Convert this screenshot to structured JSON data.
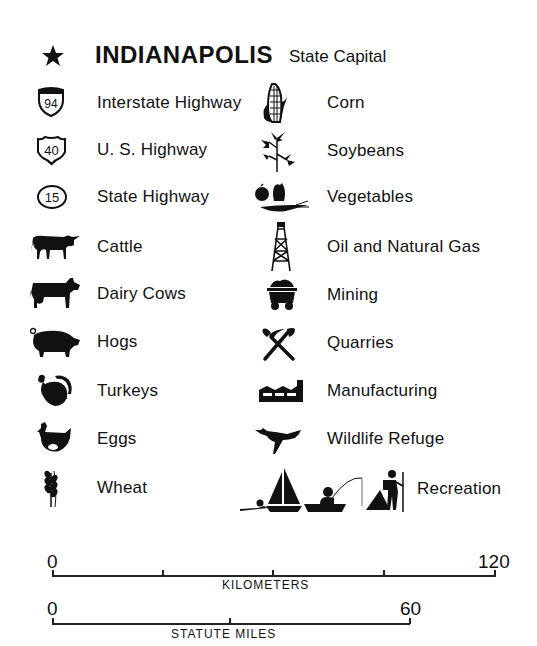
{
  "capital": {
    "name": "INDIANAPOLIS",
    "suffix": "State Capital",
    "icon": "star-icon"
  },
  "left_items": [
    {
      "label": "Interstate Highway",
      "icon": "interstate-shield-icon",
      "shield_text": "94"
    },
    {
      "label": "U. S. Highway",
      "icon": "us-highway-shield-icon",
      "shield_text": "40"
    },
    {
      "label": "State Highway",
      "icon": "state-highway-oval-icon",
      "shield_text": "15"
    },
    {
      "label": "Cattle",
      "icon": "cattle-icon"
    },
    {
      "label": "Dairy Cows",
      "icon": "dairy-cow-icon"
    },
    {
      "label": "Hogs",
      "icon": "hog-icon"
    },
    {
      "label": "Turkeys",
      "icon": "turkey-icon"
    },
    {
      "label": "Eggs",
      "icon": "hen-icon"
    },
    {
      "label": "Wheat",
      "icon": "wheat-icon"
    }
  ],
  "right_items": [
    {
      "label": "Corn",
      "icon": "corn-icon"
    },
    {
      "label": "Soybeans",
      "icon": "soybean-plant-icon"
    },
    {
      "label": "Vegetables",
      "icon": "vegetables-icon"
    },
    {
      "label": "Oil and Natural Gas",
      "icon": "oil-derrick-icon"
    },
    {
      "label": "Mining",
      "icon": "mine-cart-icon"
    },
    {
      "label": "Quarries",
      "icon": "pick-and-shovel-icon"
    },
    {
      "label": "Manufacturing",
      "icon": "factory-icon"
    },
    {
      "label": "Wildlife Refuge",
      "icon": "flying-goose-icon"
    },
    {
      "label": "Recreation",
      "icon": "recreation-icon"
    }
  ],
  "scales": {
    "kilometers": {
      "start": "0",
      "end": "120",
      "title": "KILOMETERS"
    },
    "miles": {
      "start": "0",
      "end": "60",
      "title": "STATUTE MILES"
    }
  }
}
